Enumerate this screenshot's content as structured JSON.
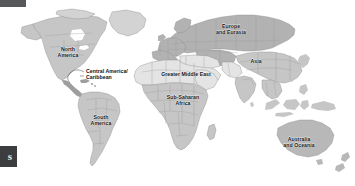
{
  "figure": {
    "kind": "world-region-map",
    "projection_note": "equirectangular world map, grayscale"
  },
  "chrome": {
    "top_bar": {
      "name": "top-left-bar"
    },
    "corner_badge": {
      "glyph": "s"
    }
  },
  "colors": {
    "ocean": "#ffffff",
    "land_light": "#d9d9d9",
    "land_mid": "#c6c6c6",
    "land_dark": "#b0b0b0",
    "land_pale": "#e6e6e6",
    "border": "#8c8c8c",
    "label_text": "#101010",
    "chrome_bar": "#57585a",
    "chrome_badge": "#3c3d3f"
  },
  "map": {
    "regions": [
      {
        "id": "north-america",
        "label": "North\nAmerica",
        "x": 68,
        "y": 52,
        "shade": "land_mid"
      },
      {
        "id": "central-america-caribbean",
        "label": "Central America/\nCaribbean",
        "x": 86,
        "y": 74,
        "shade": "land_dark",
        "callout": true
      },
      {
        "id": "south-america",
        "label": "South\nAmerica",
        "x": 101,
        "y": 120,
        "shade": "land_mid"
      },
      {
        "id": "europe-and-eurasia",
        "label": "Europe\nand Eurasia",
        "x": 231,
        "y": 29,
        "shade": "land_dark"
      },
      {
        "id": "greater-middle-east",
        "label": "Greater Middle East",
        "x": 186,
        "y": 74,
        "shade": "land_pale"
      },
      {
        "id": "sub-saharan-africa",
        "label": "Sub-Saharan\nAfrica",
        "x": 183,
        "y": 100,
        "shade": "land_mid"
      },
      {
        "id": "asia",
        "label": "Asia",
        "x": 256,
        "y": 61,
        "shade": "land_mid"
      },
      {
        "id": "australia-and-oceania",
        "label": "Australia\nand Oceania",
        "x": 299,
        "y": 142,
        "shade": "land_mid"
      }
    ]
  }
}
